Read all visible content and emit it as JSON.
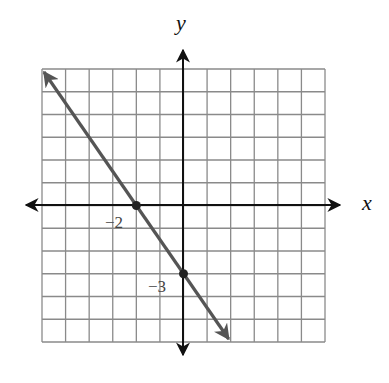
{
  "figure": {
    "type": "coordinate-plane-line-graph",
    "axes": {
      "x_label": "x",
      "y_label": "y",
      "x_range": [
        -6,
        6
      ],
      "y_range": [
        -6,
        6
      ],
      "grid_step": 1,
      "grid": true
    },
    "line": {
      "equation": "y = -3/2 x - 3",
      "slope": -1.5,
      "y_intercept": -3,
      "x_intercept": -2,
      "endpoints": [
        [
          -6,
          6
        ],
        [
          2,
          -6
        ]
      ],
      "arrows_both_ends": true
    },
    "points": [
      {
        "name": "x-intercept",
        "x": -2,
        "y": 0,
        "label": "−2"
      },
      {
        "name": "y-intercept",
        "x": 0,
        "y": -3,
        "label": "−3"
      }
    ],
    "colors": {
      "grid": "#8a8a8a",
      "axes": "#111111",
      "line": "#555555",
      "points": "#222222"
    }
  },
  "chart_data": {
    "type": "line",
    "title": "",
    "xlabel": "x",
    "ylabel": "y",
    "xlim": [
      -6,
      6
    ],
    "ylim": [
      -6,
      6
    ],
    "grid": true,
    "series": [
      {
        "name": "y = -1.5x - 3",
        "x": [
          -6,
          -2,
          0,
          2
        ],
        "y": [
          6,
          0,
          -3,
          -6
        ]
      }
    ],
    "annotations": [
      {
        "text": "−2",
        "x": -2,
        "y": 0
      },
      {
        "text": "−3",
        "x": 0,
        "y": -3
      }
    ]
  }
}
